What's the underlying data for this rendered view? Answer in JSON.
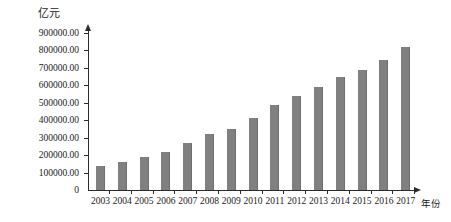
{
  "chart_data": {
    "type": "bar",
    "title": "",
    "subtitle": "",
    "unit_label": "亿元",
    "xlabel": "年份",
    "ylabel": "亿元",
    "categories": [
      "2003",
      "2004",
      "2005",
      "2006",
      "2007",
      "2008",
      "2009",
      "2010",
      "2011",
      "2012",
      "2013",
      "2014",
      "2015",
      "2016",
      "2017"
    ],
    "values": [
      135000,
      160000,
      187000,
      220000,
      270000,
      320000,
      350000,
      413000,
      490000,
      540000,
      590000,
      645000,
      690000,
      745000,
      820000
    ],
    "ylim": [
      0,
      900000
    ],
    "ytick_values": [
      0,
      100000,
      200000,
      300000,
      400000,
      500000,
      600000,
      700000,
      800000,
      900000
    ],
    "ytick_labels": [
      "0",
      "100000.00",
      "200000.00",
      "300000.00",
      "400000.00",
      "500000.00",
      "600000.00",
      "700000.00",
      "800000.00",
      "900000.00"
    ],
    "grid": false,
    "legend": null,
    "legend_position": "none",
    "bar_color": "#808080",
    "axis_color": "#2b2b2b",
    "text_color": "#1a1a1a"
  }
}
